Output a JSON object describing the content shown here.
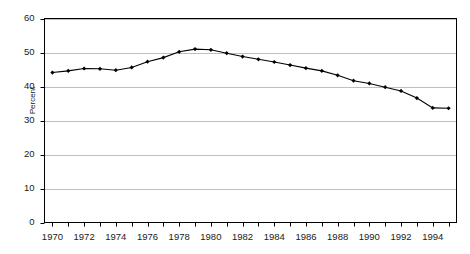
{
  "chart_data": {
    "type": "line",
    "title": "",
    "subtitle": "",
    "xlabel": "",
    "ylabel": "Percent",
    "xlim": [
      1969.5,
      1995.5
    ],
    "ylim": [
      0,
      60
    ],
    "grid": true,
    "grid_axis": "y",
    "legend": false,
    "legend_position": "none",
    "marker": "diamond",
    "line_color": "#000000",
    "marker_color": "#000000",
    "grid_color": "#bfbfbf",
    "axis_color": "#000000",
    "background": "#ffffff",
    "x": [
      1970,
      1971,
      1972,
      1973,
      1974,
      1975,
      1976,
      1977,
      1978,
      1979,
      1980,
      1981,
      1982,
      1983,
      1984,
      1985,
      1986,
      1987,
      1988,
      1989,
      1990,
      1991,
      1992,
      1993,
      1994,
      1995
    ],
    "values": [
      44.1,
      44.6,
      45.3,
      45.2,
      44.8,
      45.6,
      47.3,
      48.5,
      50.2,
      51.0,
      50.8,
      49.8,
      48.8,
      48.0,
      47.2,
      46.3,
      45.4,
      44.6,
      43.3,
      41.7,
      40.9,
      39.8,
      38.7,
      36.6,
      33.7,
      33.6
    ],
    "yticks": [
      0,
      10,
      20,
      30,
      40,
      50,
      60
    ],
    "ytick_labels": [
      "0",
      "10",
      "20",
      "30",
      "40",
      "50",
      "60"
    ],
    "xticks": [
      1970,
      1972,
      1974,
      1976,
      1978,
      1980,
      1982,
      1984,
      1986,
      1988,
      1990,
      1992,
      1994
    ],
    "xtick_labels": [
      "1970",
      "1972",
      "1974",
      "1976",
      "1978",
      "1980",
      "1982",
      "1984",
      "1986",
      "1988",
      "1990",
      "1992",
      "1994"
    ],
    "series": [
      {
        "name": "Percent",
        "values": [
          44.1,
          44.6,
          45.3,
          45.2,
          44.8,
          45.6,
          47.3,
          48.5,
          50.2,
          51.0,
          50.8,
          49.8,
          48.8,
          48.0,
          47.2,
          46.3,
          45.4,
          44.6,
          43.3,
          41.7,
          40.9,
          39.8,
          38.7,
          36.6,
          33.7,
          33.6
        ]
      }
    ]
  }
}
